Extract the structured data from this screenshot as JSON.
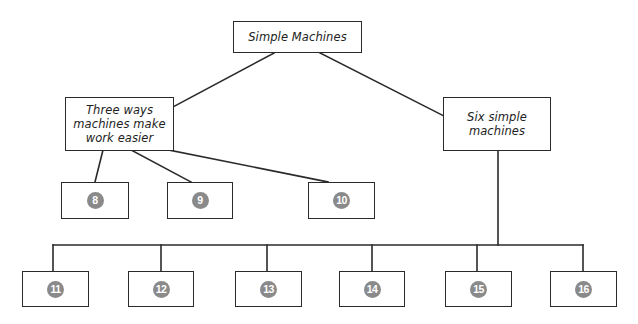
{
  "diagram": {
    "type": "concept-map",
    "root": {
      "id": "root",
      "label": "Simple Machines"
    },
    "branches": [
      {
        "id": "left",
        "label": "Three ways\nmachines make\nwork easier"
      },
      {
        "id": "right",
        "label": "Six simple\nmachines"
      }
    ],
    "blanks": [
      {
        "number": "8",
        "parent": "left"
      },
      {
        "number": "9",
        "parent": "left"
      },
      {
        "number": "10",
        "parent": "left"
      },
      {
        "number": "11",
        "parent": "right"
      },
      {
        "number": "12",
        "parent": "right"
      },
      {
        "number": "13",
        "parent": "right"
      },
      {
        "number": "14",
        "parent": "right"
      },
      {
        "number": "15",
        "parent": "right"
      },
      {
        "number": "16",
        "parent": "right"
      }
    ],
    "colors": {
      "line": "#2a2a2a",
      "badge": "#8a8a8a",
      "badge_text": "#ffffff",
      "background": "#ffffff"
    }
  }
}
